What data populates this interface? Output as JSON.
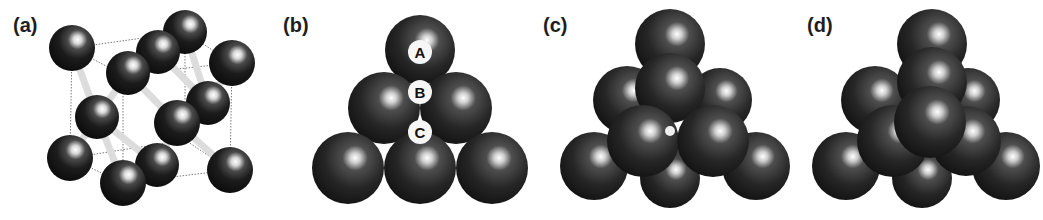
{
  "figure": {
    "panels": [
      {
        "id": "a",
        "label": "(a)",
        "description": "diamond cubic crystal structure, ball-and-stick"
      },
      {
        "id": "b",
        "label": "(b)",
        "description": "close-packed layer with stacking sites"
      },
      {
        "id": "c",
        "label": "(c)",
        "description": "two close-packed layers stacked"
      },
      {
        "id": "d",
        "label": "(d)",
        "description": "three close-packed layers stacked"
      }
    ],
    "stacking_sites": [
      {
        "label": "A"
      },
      {
        "label": "B"
      },
      {
        "label": "C"
      }
    ],
    "colors": {
      "sphere_dark": "#111111",
      "sphere_highlight": "#ffffff",
      "bond": "#e6e6e6",
      "cell_edge": "#555555",
      "background": "#ffffff"
    }
  }
}
